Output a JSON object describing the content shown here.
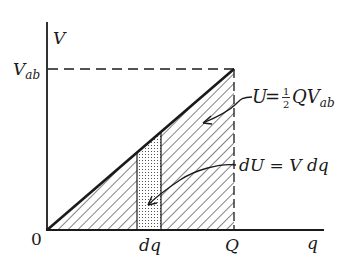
{
  "diagram": {
    "type": "energy-vs-charge",
    "axes": {
      "y_label": "V",
      "x_label": "q",
      "origin_label": "0"
    },
    "ticks": {
      "y_level_label": "V",
      "y_level_sub": "ab",
      "x_strip_label": "dq",
      "x_end_label": "Q"
    },
    "annotations": {
      "total_energy": {
        "lhs": "U",
        "eq": "=",
        "frac_num": "1",
        "frac_den": "2",
        "rhs": "QV",
        "rhs_sub": "ab"
      },
      "differential_energy": {
        "text": "dU = V dq"
      }
    },
    "colors": {
      "ink": "#1a1a1a",
      "background": "#ffffff"
    }
  }
}
